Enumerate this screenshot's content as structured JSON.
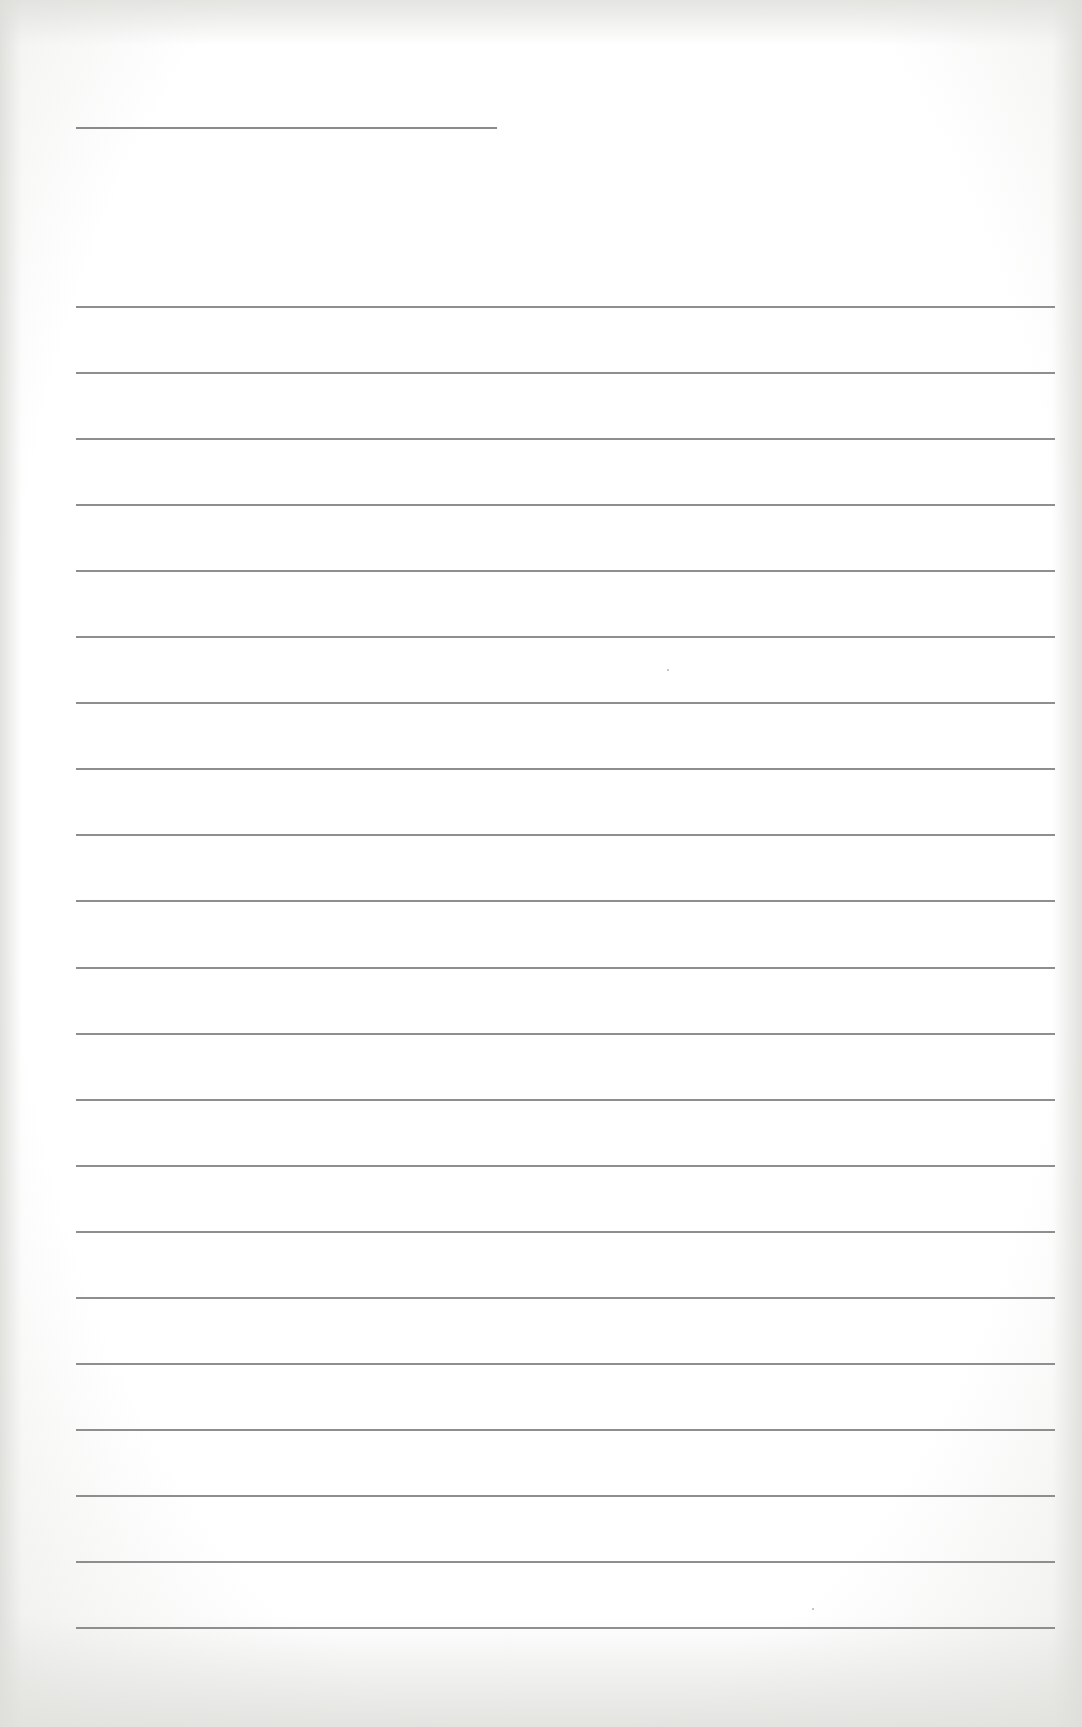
{
  "document": {
    "type": "blank lined paper",
    "name_line": {
      "x": 76,
      "y": 127,
      "width": 421
    },
    "ruled_lines": {
      "count": 21,
      "x": 76,
      "width": 979,
      "first_y": 306,
      "spacing": 66.05,
      "color": "#8e8e8e"
    },
    "paper_color": "#ffffff",
    "text": ""
  }
}
